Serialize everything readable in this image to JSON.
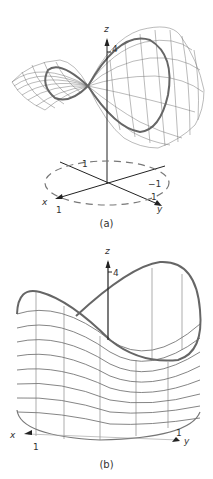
{
  "figure": {
    "panels": [
      {
        "id": "a",
        "caption": "(a)",
        "surface": "saddle (hyperbolic paraboloid) wireframe above xy-plane",
        "axes": {
          "x_label": "x",
          "y_label": "y",
          "z_label": "z"
        },
        "tick_labels": {
          "z_tick": "4",
          "x_tick": "1",
          "y_tick": "1",
          "neg_y_tick": "−1",
          "neg_x_tick": "1"
        },
        "annotations": [
          "dashed unit circle in xy-plane",
          "thick curve: boundary trace on surface over unit circle"
        ]
      },
      {
        "id": "b",
        "caption": "(b)",
        "surface": "cylinder x^2+y^2=1 cut by saddle surface (wireframe)",
        "axes": {
          "x_label": "x",
          "y_label": "y",
          "z_label": "z"
        },
        "tick_labels": {
          "z_tick": "4",
          "x_tick": "1",
          "y_tick": "1"
        },
        "annotations": [
          "thick curve: top edge where cylinder meets saddle",
          "unit circle base"
        ]
      }
    ],
    "colors": {
      "line": "#555555",
      "thick": "#666666",
      "axis": "#222222",
      "dash": "#777777"
    }
  }
}
